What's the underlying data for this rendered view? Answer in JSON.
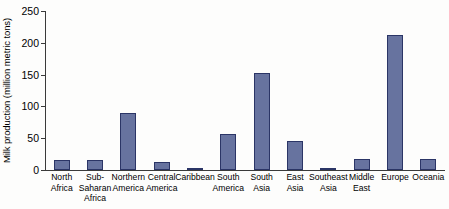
{
  "chart_data": {
    "type": "bar",
    "title": "",
    "xlabel": "",
    "ylabel": "Milk production (million metric tons)",
    "ylim": [
      0,
      250
    ],
    "yticks": [
      0,
      50,
      100,
      150,
      200,
      250
    ],
    "grid": false,
    "legend": false,
    "bar_color": "#67739f",
    "bar_edge_color": "#2b3566",
    "axis_color": "#3a3a3a",
    "categories": [
      "North Africa",
      "Sub-Saharan Africa",
      "Northern America",
      "Central America",
      "Caribbean",
      "South America",
      "South Asia",
      "East Asia",
      "Southeast Asia",
      "Middle East",
      "Europe",
      "Oceania"
    ],
    "category_lines": [
      [
        "North",
        "Africa"
      ],
      [
        "Sub-",
        "Saharan",
        "Africa"
      ],
      [
        "Northern",
        "America"
      ],
      [
        "Central",
        "America"
      ],
      [
        "Caribbean"
      ],
      [
        "South",
        "America"
      ],
      [
        "South",
        "Asia"
      ],
      [
        "East",
        "Asia"
      ],
      [
        "Southeast",
        "Asia"
      ],
      [
        "Middle",
        "East"
      ],
      [
        "Europe"
      ],
      [
        "Oceania"
      ]
    ],
    "values": [
      15,
      15,
      90,
      13,
      3,
      56,
      152,
      46,
      3,
      17,
      212,
      17
    ]
  }
}
